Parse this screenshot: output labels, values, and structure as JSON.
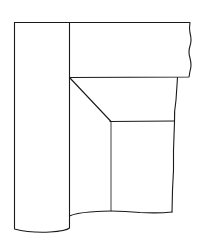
{
  "diagram": {
    "type": "line-drawing",
    "colors": {
      "background": "#ffffff",
      "stroke": "#1a1a1a"
    },
    "shapes": [
      {
        "name": "left-column",
        "kind": "rectangle-with-curved-bottom"
      },
      {
        "name": "top-bar",
        "kind": "rectangle-with-wavy-right-edge"
      },
      {
        "name": "diagonal-bevel",
        "kind": "line"
      },
      {
        "name": "inner-panel",
        "kind": "rectangle"
      },
      {
        "name": "lower-wall",
        "kind": "region-with-wavy-right-edge"
      }
    ]
  }
}
